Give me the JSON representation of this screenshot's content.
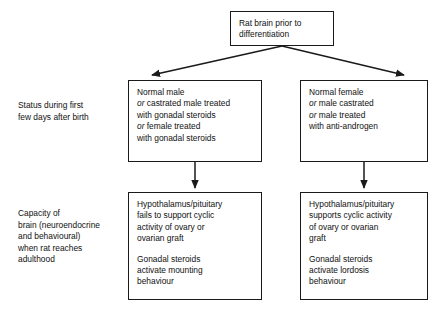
{
  "diagram": {
    "line_color": "#1a1a1a",
    "background": "#ffffff"
  },
  "root": {
    "lines": [
      {
        "text": "Rat brain prior to"
      },
      {
        "text": "differentiation"
      }
    ]
  },
  "row_labels": {
    "status": {
      "lines": [
        {
          "text": "Status during first"
        },
        {
          "text": "few days after birth"
        }
      ]
    },
    "capacity": {
      "lines": [
        {
          "text": "Capacity of"
        },
        {
          "text": "brain (neuroendocrine"
        },
        {
          "text": "and behavioural)"
        },
        {
          "text": "when rat reaches"
        },
        {
          "text": "adulthood"
        }
      ]
    }
  },
  "branches": {
    "male": {
      "condition": {
        "lines": [
          {
            "lead": "",
            "text": "Normal male"
          },
          {
            "lead": "or",
            "text": " castrated male treated"
          },
          {
            "lead": "",
            "text": "with gonadal steroids"
          },
          {
            "lead": "or",
            "text": " female treated"
          },
          {
            "lead": "",
            "text": "with gonadal steroids"
          }
        ]
      },
      "outcome": {
        "paragraph1": [
          {
            "text": "Hypothalamus/pituitary"
          },
          {
            "text": "fails to support cyclic"
          },
          {
            "text": "activity of ovary or"
          },
          {
            "text": "ovarian graft"
          }
        ],
        "paragraph2": [
          {
            "text": "Gonadal steroids"
          },
          {
            "text": "activate mounting"
          },
          {
            "text": "behaviour"
          }
        ]
      }
    },
    "female": {
      "condition": {
        "lines": [
          {
            "lead": "",
            "text": "Normal female"
          },
          {
            "lead": "or",
            "text": " male castrated"
          },
          {
            "lead": "or",
            "text": " male treated"
          },
          {
            "lead": "",
            "text": "with anti-androgen"
          }
        ]
      },
      "outcome": {
        "paragraph1": [
          {
            "text": "Hypothalamus/pituitary"
          },
          {
            "text": "supports cyclic activity"
          },
          {
            "text": "of ovary or ovarian"
          },
          {
            "text": "graft"
          }
        ],
        "paragraph2": [
          {
            "text": "Gonadal steroids"
          },
          {
            "text": "activate lordosis"
          },
          {
            "text": "behaviour"
          }
        ]
      }
    }
  }
}
